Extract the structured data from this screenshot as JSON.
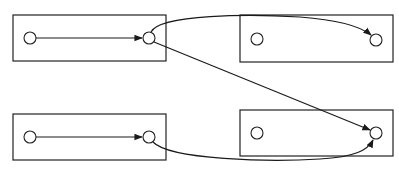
{
  "diagram": {
    "type": "block-node-graph",
    "colors": {
      "stroke": "#222222",
      "background": "#ffffff"
    },
    "boxes": [
      {
        "id": "top-left",
        "x": 13,
        "y": 15,
        "w": 153,
        "h": 46
      },
      {
        "id": "top-right",
        "x": 240,
        "y": 15,
        "w": 153,
        "h": 47
      },
      {
        "id": "bottom-left",
        "x": 13,
        "y": 114,
        "w": 153,
        "h": 46
      },
      {
        "id": "bottom-right",
        "x": 240,
        "y": 110,
        "w": 153,
        "h": 46
      }
    ],
    "nodes": [
      {
        "id": "tl-in",
        "box": "top-left",
        "cx": 30,
        "cy": 38,
        "r": 6
      },
      {
        "id": "tl-out",
        "box": "top-left",
        "cx": 149,
        "cy": 38,
        "r": 6
      },
      {
        "id": "tr-a",
        "box": "top-right",
        "cx": 257,
        "cy": 39,
        "r": 6
      },
      {
        "id": "tr-b",
        "box": "top-right",
        "cx": 376,
        "cy": 40,
        "r": 6
      },
      {
        "id": "bl-in",
        "box": "bottom-left",
        "cx": 30,
        "cy": 137,
        "r": 6
      },
      {
        "id": "bl-out",
        "box": "bottom-left",
        "cx": 149,
        "cy": 137,
        "r": 6
      },
      {
        "id": "br-a",
        "box": "bottom-right",
        "cx": 257,
        "cy": 133,
        "r": 6
      },
      {
        "id": "br-b",
        "box": "bottom-right",
        "cx": 376,
        "cy": 133,
        "r": 6
      }
    ],
    "edges": [
      {
        "from": "tl-in",
        "to": "tl-out",
        "shape": "straight"
      },
      {
        "from": "tl-out",
        "to": "tr-b",
        "shape": "curve-up"
      },
      {
        "from": "tl-out",
        "to": "br-b",
        "shape": "straight-diagonal"
      },
      {
        "from": "bl-in",
        "to": "bl-out",
        "shape": "straight"
      },
      {
        "from": "bl-out",
        "to": "br-b",
        "shape": "curve-down"
      }
    ]
  }
}
